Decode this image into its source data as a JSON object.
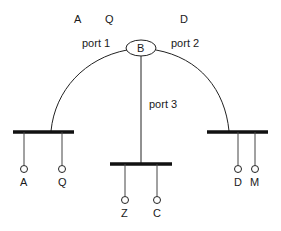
{
  "diagram": {
    "bridge_label": "B",
    "top_labels": [
      "A",
      "Q",
      "D"
    ],
    "ports": [
      "port 1",
      "port 2",
      "port 3"
    ],
    "segments": [
      {
        "name": "left",
        "stations": [
          "A",
          "Q"
        ]
      },
      {
        "name": "middle",
        "stations": [
          "Z",
          "C"
        ]
      },
      {
        "name": "right",
        "stations": [
          "D",
          "M"
        ]
      }
    ]
  }
}
